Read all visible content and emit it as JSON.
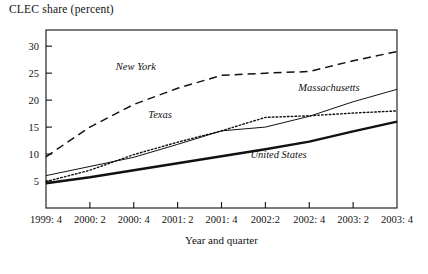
{
  "chart_data": {
    "type": "line",
    "title": "CLEC share (percent)",
    "ylabel": "CLEC share (percent)",
    "xlabel": "Year and quarter",
    "grid": false,
    "legend_position": "inline-annotations",
    "ylim": [
      0,
      33
    ],
    "yticks": [
      5,
      10,
      15,
      20,
      25,
      30
    ],
    "ytick_labels": [
      "5",
      "10",
      "15",
      "20",
      "25",
      "30"
    ],
    "categories": [
      "1999: 4",
      "2000: 2",
      "2000: 4",
      "2001: 2",
      "2001: 4",
      "2002:2",
      "2002: 4",
      "2003: 2",
      "2003: 4"
    ],
    "xtick_labels": [
      "1999: 4",
      "2000: 2",
      "2000: 4",
      "2001: 2",
      "2001: 4",
      "2002:2",
      "2002: 4",
      "2003: 2",
      "2003: 4"
    ],
    "series": [
      {
        "name": "New York",
        "label": "New York",
        "style": "dashed",
        "color": "#111111",
        "width": 1.5,
        "values": [
          9.5,
          15.0,
          19.2,
          22.2,
          24.6,
          25.0,
          25.3,
          27.3,
          29.0
        ],
        "label_x": 2.05,
        "label_y": 25.6
      },
      {
        "name": "Massachusetts",
        "label": "Massachusetts",
        "style": "solid-thin",
        "color": "#111111",
        "width": 1.0,
        "values": [
          6.0,
          7.7,
          9.4,
          11.8,
          14.3,
          15.0,
          17.0,
          19.7,
          22.0
        ],
        "label_x": 6.45,
        "label_y": 21.6
      },
      {
        "name": "Texas",
        "label": "Texas",
        "style": "dotted",
        "color": "#111111",
        "width": 1.4,
        "values": [
          4.9,
          7.0,
          9.9,
          12.2,
          14.3,
          16.8,
          17.1,
          17.6,
          18.0
        ],
        "label_x": 2.6,
        "label_y": 16.6
      },
      {
        "name": "United States",
        "label": "United States",
        "style": "solid-thick",
        "color": "#111111",
        "width": 2.4,
        "values": [
          4.6,
          5.7,
          7.0,
          8.3,
          9.6,
          10.9,
          12.3,
          14.2,
          16.0
        ],
        "label_x": 5.3,
        "label_y": 9.3
      }
    ]
  }
}
